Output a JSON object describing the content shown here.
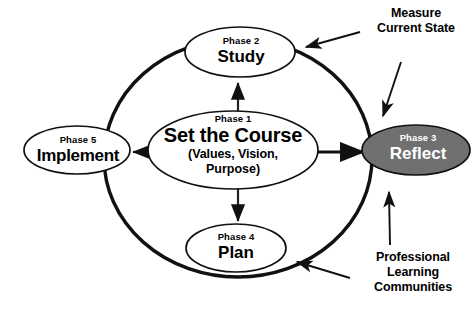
{
  "diagram": {
    "colors": {
      "background": "#ffffff",
      "stroke": "#000000",
      "node_fill": "#ffffff",
      "highlight_fill": "#707070",
      "highlight_text": "#ffffff"
    },
    "nodes": [
      {
        "id": "center",
        "phase": "Phase 1",
        "title": "Set the Course",
        "sub_line_1": "(Values, Vision,",
        "sub_line_2": "Purpose)",
        "fill": "#ffffff"
      },
      {
        "id": "study",
        "phase": "Phase 2",
        "title": "Study",
        "fill": "#ffffff"
      },
      {
        "id": "reflect",
        "phase": "Phase 3",
        "title": "Reflect",
        "fill": "#707070"
      },
      {
        "id": "plan",
        "phase": "Phase 4",
        "title": "Plan",
        "fill": "#ffffff"
      },
      {
        "id": "implement",
        "phase": "Phase 5",
        "title": "Implement",
        "fill": "#ffffff"
      }
    ],
    "annotations": [
      {
        "id": "measure",
        "lines": [
          "Measure",
          "Current State"
        ]
      },
      {
        "id": "plc",
        "lines": [
          "Professional",
          "Learning",
          "Communities"
        ]
      }
    ]
  }
}
